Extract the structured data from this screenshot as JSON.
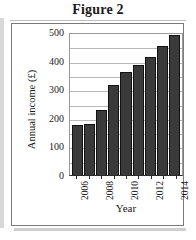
{
  "figure": {
    "title": "Figure 2"
  },
  "chart_data": {
    "type": "bar",
    "title": "Figure 2",
    "xlabel": "Year",
    "ylabel": "Annual income (£)",
    "categories": [
      "2006",
      "2007",
      "2008",
      "2009",
      "2010",
      "2011",
      "2012",
      "2013",
      "2014"
    ],
    "values": [
      175,
      180,
      228,
      313,
      360,
      385,
      413,
      450,
      490
    ],
    "ylim": [
      0,
      500
    ],
    "y_ticks": [
      0,
      100,
      200,
      300,
      400,
      500
    ],
    "y_tick_labels": [
      "0",
      "100",
      "200",
      "300",
      "400",
      "500"
    ],
    "x_tick_labels": [
      "2006",
      "",
      "2008",
      "",
      "2010",
      "",
      "2012",
      "",
      "2014"
    ],
    "gridlines": [
      50,
      100,
      150,
      200,
      250,
      300,
      350,
      400,
      450
    ],
    "grid": true,
    "legend": null,
    "bar_color": "#3a3a3a",
    "bar_edge_color": "#121212",
    "grid_color": "#b9b9b9"
  }
}
